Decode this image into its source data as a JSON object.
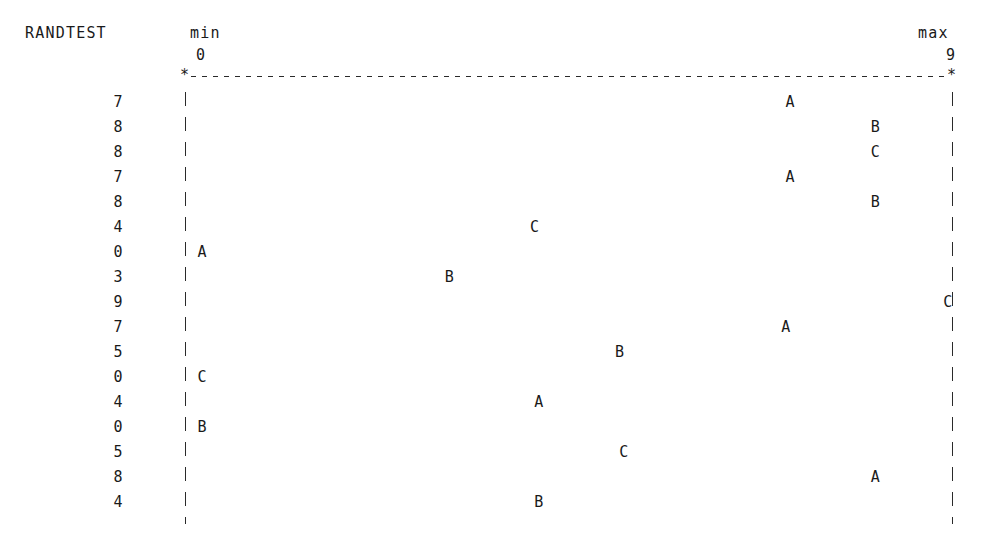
{
  "header": {
    "title": "RANDTEST",
    "min_label": "min",
    "min_value": "0",
    "max_label": "max",
    "max_value": "9",
    "star_glyph": "*"
  },
  "axis": {
    "left_x_px": 185,
    "right_x_px": 952,
    "min": 0,
    "max": 9,
    "style": "dashed"
  },
  "chart_data": {
    "type": "scatter",
    "title": "RANDTEST",
    "xlabel": "",
    "ylabel": "",
    "xlim": [
      0,
      9
    ],
    "grid": false,
    "legend": "none",
    "axis_min_label": "min",
    "axis_max_label": "max",
    "axis_min_value": "0",
    "axis_max_value": "9",
    "row_labels": [
      "7",
      "8",
      "8",
      "7",
      "8",
      "4",
      "0",
      "3",
      "9",
      "7",
      "5",
      "0",
      "4",
      "0",
      "5",
      "8",
      "4"
    ],
    "series": [
      {
        "name": "A",
        "marker": "A"
      },
      {
        "name": "B",
        "marker": "B"
      },
      {
        "name": "C",
        "marker": "C"
      }
    ],
    "rows": [
      {
        "label": "7",
        "points": [
          {
            "series": "A",
            "x": 7.0
          }
        ]
      },
      {
        "label": "8",
        "points": [
          {
            "series": "B",
            "x": 8.0
          }
        ]
      },
      {
        "label": "8",
        "points": [
          {
            "series": "C",
            "x": 8.0
          }
        ]
      },
      {
        "label": "7",
        "points": [
          {
            "series": "A",
            "x": 7.0
          }
        ]
      },
      {
        "label": "8",
        "points": [
          {
            "series": "B",
            "x": 8.0
          }
        ]
      },
      {
        "label": "4",
        "points": [
          {
            "series": "C",
            "x": 4.0
          }
        ]
      },
      {
        "label": "0",
        "points": [
          {
            "series": "A",
            "x": 0.1
          }
        ]
      },
      {
        "label": "3",
        "points": [
          {
            "series": "B",
            "x": 3.0
          }
        ]
      },
      {
        "label": "9",
        "points": [
          {
            "series": "C",
            "x": 8.85
          }
        ]
      },
      {
        "label": "7",
        "points": [
          {
            "series": "A",
            "x": 6.95
          }
        ]
      },
      {
        "label": "5",
        "points": [
          {
            "series": "B",
            "x": 5.0
          }
        ]
      },
      {
        "label": "0",
        "points": [
          {
            "series": "C",
            "x": 0.1
          }
        ]
      },
      {
        "label": "4",
        "points": [
          {
            "series": "A",
            "x": 4.05
          }
        ]
      },
      {
        "label": "0",
        "points": [
          {
            "series": "B",
            "x": 0.1
          }
        ]
      },
      {
        "label": "5",
        "points": [
          {
            "series": "C",
            "x": 5.05
          }
        ]
      },
      {
        "label": "8",
        "points": [
          {
            "series": "A",
            "x": 8.0
          }
        ]
      },
      {
        "label": "4",
        "points": [
          {
            "series": "B",
            "x": 4.05
          }
        ]
      }
    ]
  }
}
